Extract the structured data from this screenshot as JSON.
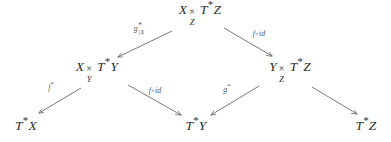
{
  "diagram": {
    "type": "commutative-diagram",
    "colors": {
      "text": "#2c2c2c",
      "label": "#555555",
      "arrow": "#6b6b6b",
      "background": "#ffffff"
    },
    "nodes": [
      {
        "id": "top",
        "label": "X ×_Z T*Z",
        "lhs": "X",
        "prod_symbol": "×",
        "prod_subscript": "Z",
        "rhs_base": "T",
        "rhs_star": "*",
        "rhs_tail": "Z",
        "x": 200,
        "y": 14
      },
      {
        "id": "mid-left",
        "label": "X ×_Y T*Y",
        "lhs": "X",
        "prod_symbol": "×",
        "prod_subscript": "Y",
        "rhs_base": "T",
        "rhs_star": "*",
        "rhs_tail": "Y",
        "x": 97,
        "y": 71
      },
      {
        "id": "mid-right",
        "label": "Y ×_Z T*Z",
        "lhs": "Y",
        "prod_symbol": "×",
        "prod_subscript": "Z",
        "rhs_base": "T",
        "rhs_star": "*",
        "rhs_tail": "Z",
        "x": 290,
        "y": 71
      },
      {
        "id": "bottom-left",
        "label": "T*X",
        "base": "T",
        "star": "*",
        "tail": "X",
        "x": 26,
        "y": 126
      },
      {
        "id": "bottom-middle",
        "label": "T*Y",
        "base": "T",
        "star": "*",
        "tail": "Y",
        "x": 196,
        "y": 126
      },
      {
        "id": "bottom-right",
        "label": "T*Z",
        "base": "T",
        "star": "*",
        "tail": "Z",
        "x": 366,
        "y": 126
      }
    ],
    "edges": [
      {
        "id": "top-to-midleft",
        "from": "top",
        "to": "mid-left",
        "label": "g*|X",
        "label_kind": "g-restricted",
        "label_base": "g",
        "label_sup": "*",
        "label_sub": "|X",
        "label_x": 139,
        "label_y": 29,
        "x1": 172,
        "y1": 31,
        "x2": 118,
        "y2": 57
      },
      {
        "id": "top-to-midright",
        "from": "top",
        "to": "mid-right",
        "label": "f×id",
        "label_kind": "f-times-id",
        "label_f": "f",
        "label_times": "×",
        "label_id": "id",
        "label_x": 259,
        "label_y": 34,
        "x1": 224,
        "y1": 28,
        "x2": 272,
        "y2": 56
      },
      {
        "id": "midleft-to-bottomleft",
        "from": "mid-left",
        "to": "bottom-left",
        "label": "f*",
        "label_kind": "f-star",
        "label_base": "f",
        "label_sup": "*",
        "label_x": 51,
        "label_y": 88,
        "x1": 81,
        "y1": 88,
        "x2": 39,
        "y2": 113
      },
      {
        "id": "midleft-to-bottommiddle",
        "from": "mid-left",
        "to": "bottom-middle",
        "label": "f×id",
        "label_kind": "f-times-id",
        "label_f": "f",
        "label_times": "×",
        "label_id": "id",
        "label_x": 155,
        "label_y": 91,
        "x1": 128,
        "y1": 85,
        "x2": 181,
        "y2": 115
      },
      {
        "id": "midright-to-bottommiddle",
        "from": "mid-right",
        "to": "bottom-middle",
        "label": "g*",
        "label_kind": "f-star",
        "label_base": "g",
        "label_sup": "*",
        "label_x": 227,
        "label_y": 90,
        "x1": 259,
        "y1": 86,
        "x2": 211,
        "y2": 115
      },
      {
        "id": "midright-to-bottomright",
        "from": "mid-right",
        "to": "bottom-right",
        "label": "",
        "label_kind": "none",
        "label_x": 0,
        "label_y": 0,
        "x1": 312,
        "y1": 87,
        "x2": 357,
        "y2": 114
      }
    ]
  }
}
